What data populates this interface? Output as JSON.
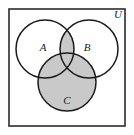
{
  "figure": {
    "type": "venn-diagram",
    "background_color": "#ffffff",
    "stroke_color": "#1a1a1a",
    "shade_color": "#c9c9c9",
    "universe": {
      "label": "U",
      "label_x": 118,
      "label_y": 18,
      "rect": {
        "x": 9,
        "y": 9,
        "width": 116,
        "height": 117
      },
      "border_color": "#2b2b2b",
      "border_width": 1.6
    },
    "circles": [
      {
        "id": "A",
        "label": "A",
        "cx": 45,
        "cy": 49,
        "r": 29,
        "label_x": 43,
        "label_y": 51
      },
      {
        "id": "B",
        "label": "B",
        "cx": 89,
        "cy": 49,
        "r": 29,
        "label_x": 87,
        "label_y": 51
      },
      {
        "id": "C",
        "label": "C",
        "cx": 67,
        "cy": 82,
        "r": 29,
        "label_x": 67,
        "label_y": 104
      }
    ],
    "shaded_regions": [
      {
        "id": "C-full",
        "description": "entire circle C"
      },
      {
        "id": "A-inter-B",
        "description": "intersection of A and B"
      }
    ],
    "shaded_expression": "C union (A intersect B)"
  }
}
